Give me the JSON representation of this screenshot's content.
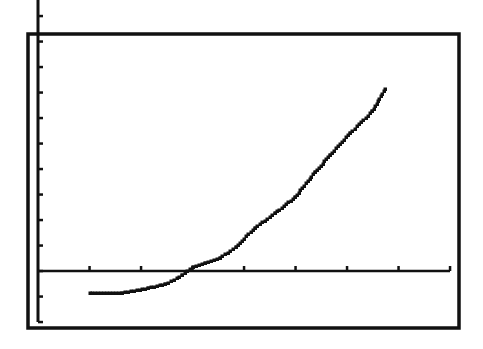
{
  "chart_data": {
    "type": "line",
    "title": "",
    "xlabel": "",
    "ylabel": "",
    "grid": false,
    "legend": null,
    "style": "graphing-calculator-screen",
    "axis_ranges": {
      "xlim": [
        0,
        8
      ],
      "ylim": [
        -2,
        11
      ]
    },
    "x_ticks": [
      1,
      2,
      3,
      4,
      5,
      6,
      7,
      8
    ],
    "y_ticks": [
      -2,
      -1,
      0,
      1,
      2,
      3,
      4,
      5,
      6,
      7,
      8,
      9,
      10,
      11
    ],
    "series": [
      {
        "name": "curve",
        "x": [
          1.0,
          1.64,
          2.14,
          2.47,
          2.8,
          3.0,
          3.24,
          3.53,
          3.84,
          4.21,
          4.6,
          4.99,
          5.38,
          5.67,
          6.06,
          6.49,
          6.74
        ],
        "y": [
          -0.86,
          -0.86,
          -0.67,
          -0.51,
          -0.16,
          0.16,
          0.31,
          0.51,
          0.94,
          1.69,
          2.27,
          2.9,
          3.88,
          4.55,
          5.41,
          6.27,
          7.14
        ]
      }
    ]
  },
  "colors": {
    "background": "#ffffff",
    "ink": "#111111"
  },
  "layout_px": {
    "frame": {
      "x": 28,
      "y": 34,
      "w": 431,
      "h": 294
    },
    "origin": {
      "x": 38,
      "y": 271
    },
    "x_unit": 51.5,
    "y_unit": 25.5
  }
}
